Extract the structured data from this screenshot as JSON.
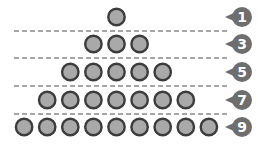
{
  "diagram": {
    "title": "",
    "rows": [
      {
        "count": 1,
        "label": "1"
      },
      {
        "count": 3,
        "label": "3"
      },
      {
        "count": 5,
        "label": "5"
      },
      {
        "count": 7,
        "label": "7"
      },
      {
        "count": 9,
        "label": "9"
      }
    ],
    "colors": {
      "circle_fill": "#a9a9a9",
      "circle_stroke": "#3c3c3c",
      "badge_fill": "#6e6e6e",
      "badge_text": "#ffffff",
      "divider": "#888888",
      "background": "#ffffff"
    }
  }
}
